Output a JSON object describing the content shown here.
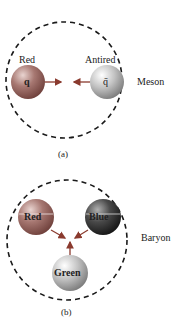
{
  "panel_a": {
    "caption": "(a)",
    "side_label": "Meson",
    "left_particle": {
      "color_label": "Red",
      "symbol": "q"
    },
    "right_particle": {
      "color_label": "Antired",
      "symbol": "q̄"
    }
  },
  "panel_b": {
    "caption": "(b)",
    "side_label": "Baryon",
    "particles": [
      {
        "label": "Red"
      },
      {
        "label": "Blue"
      },
      {
        "label": "Green"
      }
    ]
  },
  "colors": {
    "red_quark": "#9e6a64",
    "antired_quark": "#b9b9b9",
    "blue_quark": "#3a3a3a",
    "green_quark": "#bdbdbd",
    "arrow": "#8a3a2e",
    "dashes": "#1a1a1a"
  }
}
